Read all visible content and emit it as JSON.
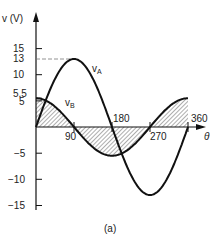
{
  "chart_data": {
    "type": "line",
    "title": "",
    "caption": "(a)",
    "xlabel": "θ",
    "ylabel": "v (V)",
    "xlim": [
      0,
      360
    ],
    "ylim": [
      -15,
      15
    ],
    "x_ticks": [
      90,
      180,
      270,
      360
    ],
    "y_ticks": [
      15,
      13,
      10,
      5.5,
      5,
      -5,
      -10,
      -15
    ],
    "grid": false,
    "x": [
      0,
      30,
      60,
      90,
      120,
      150,
      180,
      210,
      240,
      270,
      300,
      330,
      360
    ],
    "series": [
      {
        "name": "vA",
        "label_main": "v",
        "label_sub": "A",
        "amplitude": 13,
        "function": "13 sin θ",
        "values": [
          0,
          6.5,
          11.26,
          13,
          11.26,
          6.5,
          0,
          -6.5,
          -11.26,
          -13,
          -11.26,
          -6.5,
          0
        ]
      },
      {
        "name": "vB",
        "label_main": "v",
        "label_sub": "B",
        "amplitude": 5.5,
        "function": "5.5 cos θ",
        "values": [
          5.5,
          4.76,
          2.75,
          0,
          -2.75,
          -4.76,
          -5.5,
          -4.76,
          -2.75,
          0,
          2.75,
          4.76,
          5.5
        ]
      }
    ],
    "annotations": [
      "hatched area between vB and θ-axis",
      "dashed line at v = 13 to peak of vA"
    ]
  },
  "labels": {
    "ylabel": "v (V)",
    "xlabel": "θ",
    "caption": "(a)",
    "tick_15": "15",
    "tick_13": "13",
    "tick_10": "10",
    "tick_5_5": "5,5",
    "tick_5": "5",
    "tick_m5": "−5",
    "tick_m10": "−10",
    "tick_m15": "−15",
    "tick_90": "90",
    "tick_180": "180",
    "tick_270": "270",
    "tick_360": "360",
    "vA_main": "v",
    "vA_sub": "A",
    "vB_main": "v",
    "vB_sub": "B"
  }
}
